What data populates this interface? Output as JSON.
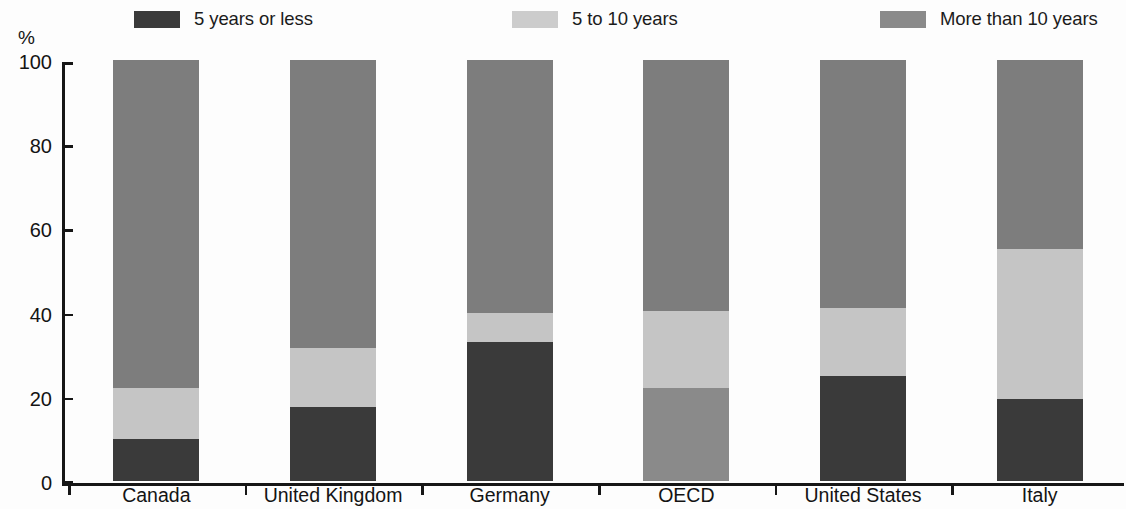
{
  "chart_data": {
    "type": "bar",
    "subtype": "stacked-bar-100",
    "title": "",
    "xlabel": "",
    "ylabel": "%",
    "ylim": [
      0,
      100
    ],
    "yticks": [
      0,
      20,
      40,
      60,
      80,
      100
    ],
    "ytick_labels": [
      "0",
      "20",
      "40",
      "60",
      "80",
      "100"
    ],
    "grid": false,
    "legend_position": "top",
    "categories": [
      "Canada",
      "United Kingdom",
      "Germany",
      "OECD",
      "United States",
      "Italy"
    ],
    "series": [
      {
        "name": "5 years or less",
        "color": "#3a3a3a",
        "values": [
          10,
          17.5,
          33,
          22,
          25,
          19.5
        ]
      },
      {
        "name": "5 to 10 years",
        "color": "#c5c5c5",
        "values": [
          12,
          14,
          7,
          18.5,
          16,
          35.5
        ]
      },
      {
        "name": "More than 10 years",
        "color": "#7d7d7d",
        "values": [
          78,
          68.5,
          60,
          59.5,
          59,
          45
        ]
      }
    ],
    "segment_colors_override": {
      "OECD": {
        "5 years or less": "#8a8a8a"
      }
    }
  },
  "legend": {
    "items": [
      {
        "label": "5 years or less",
        "swatch_color": "#3a3a3a",
        "swatch_name": "legend-swatch-5-years-or-less"
      },
      {
        "label": "5 to 10 years",
        "swatch_color": "#cccccc",
        "swatch_name": "legend-swatch-5-to-10-years"
      },
      {
        "label": "More than 10 years",
        "swatch_color": "#8a8a8a",
        "swatch_name": "legend-swatch-more-than-10-years"
      }
    ]
  },
  "axis": {
    "y_unit": "%",
    "y_labels": [
      "100",
      "80",
      "60",
      "40",
      "20",
      "0"
    ],
    "x_labels": [
      "Canada",
      "United Kingdom",
      "Germany",
      "OECD",
      "United States",
      "Italy"
    ]
  }
}
